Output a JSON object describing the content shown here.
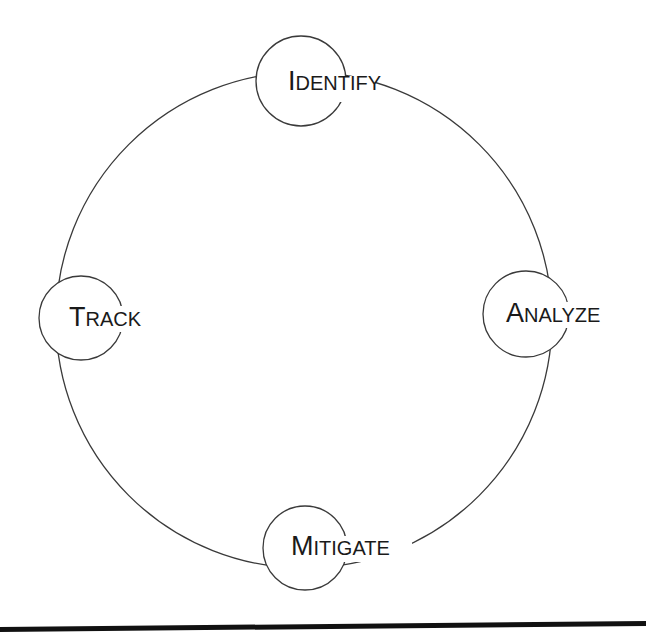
{
  "diagram": {
    "type": "cycle",
    "title": "",
    "ring": {
      "cx": 304,
      "cy": 320,
      "r": 248,
      "stroke": "#3a3a3a"
    },
    "node_stroke": "#3a3a3a",
    "text_color": "#1a1a1a",
    "nodes": [
      {
        "id": "identify",
        "label": "Identify",
        "cap": "I",
        "rest": "DENTIFY",
        "cx": 301,
        "cy": 81,
        "r": 45
      },
      {
        "id": "analyze",
        "label": "Analyze",
        "cap": "A",
        "rest": "NALYZE",
        "cx": 526,
        "cy": 314,
        "r": 43
      },
      {
        "id": "mitigate",
        "label": "Mitigate",
        "cap": "M",
        "rest": "ITIGATE",
        "cx": 305,
        "cy": 548,
        "r": 42
      },
      {
        "id": "track",
        "label": "Track",
        "cap": "T",
        "rest": "RACK",
        "cx": 81,
        "cy": 318,
        "r": 42
      }
    ],
    "cycle_order": [
      "Identify",
      "Analyze",
      "Mitigate",
      "Track"
    ],
    "bottom_rule": {
      "color": "#111111"
    }
  }
}
